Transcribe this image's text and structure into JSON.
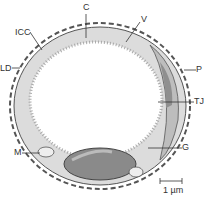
{
  "diagram": {
    "type": "cross-section of capillary / endothelial cell",
    "labels": {
      "C": "C",
      "V": "V",
      "ICC": "ICC",
      "LD": "LD",
      "P": "P",
      "TJ": "TJ",
      "M": "M",
      "G": "G"
    },
    "scale_bar": "1 µm",
    "colors": {
      "cytoplasm": "#dcdcdc",
      "nucleus": "#8a8a8a",
      "pericyte": "#9a9a9a",
      "outline": "#555555",
      "background": "#ffffff"
    }
  }
}
